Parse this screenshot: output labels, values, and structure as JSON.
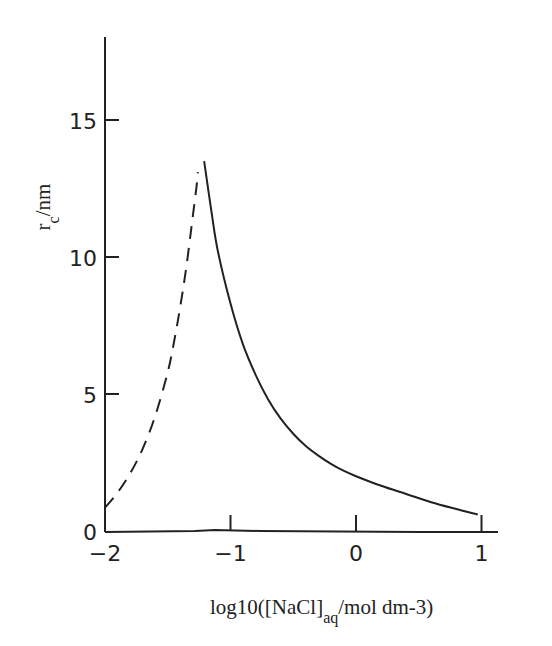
{
  "chart_data": {
    "type": "line",
    "title": "",
    "xlabel": "log10([NaCl]aq/mol dm-3)",
    "xlabel_parts": {
      "pre": "log10([NaCl]",
      "sub": "aq",
      "post": "/mol dm-3)"
    },
    "ylabel": "rc/nm",
    "ylabel_parts": {
      "main": "r",
      "sub": "c",
      "post": "/nm"
    },
    "xlim": [
      -2,
      1.3
    ],
    "ylim": [
      0,
      18
    ],
    "x_ticks": [
      -2,
      -1,
      0,
      1
    ],
    "x_tick_labels": [
      "−2",
      "−1",
      "0",
      "1"
    ],
    "y_ticks": [
      0,
      5,
      10,
      15
    ],
    "y_tick_labels": [
      "0",
      "5",
      "10",
      "15"
    ],
    "grid": false,
    "legend": null,
    "series": [
      {
        "name": "solid",
        "style": "solid",
        "x": [
          -1.21,
          -1.15,
          -1.1,
          -1.0,
          -0.9,
          -0.8,
          -0.7,
          -0.6,
          -0.5,
          -0.4,
          -0.3,
          -0.2,
          -0.1,
          0.0,
          0.2,
          0.4,
          0.6,
          0.8,
          0.97
        ],
        "y": [
          13.5,
          11.6,
          10.2,
          8.3,
          6.8,
          5.7,
          4.8,
          4.1,
          3.55,
          3.1,
          2.75,
          2.45,
          2.2,
          2.0,
          1.65,
          1.35,
          1.05,
          0.8,
          0.6
        ]
      },
      {
        "name": "dashed",
        "style": "dashed",
        "x": [
          -2.0,
          -1.9,
          -1.8,
          -1.7,
          -1.6,
          -1.5,
          -1.45,
          -1.4,
          -1.35,
          -1.3,
          -1.27,
          -1.26
        ],
        "y": [
          0.85,
          1.4,
          2.1,
          3.0,
          4.2,
          5.8,
          6.9,
          8.2,
          9.7,
          11.5,
          12.6,
          13.1
        ]
      }
    ]
  }
}
